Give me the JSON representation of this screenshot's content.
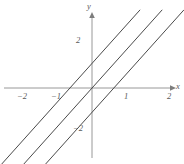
{
  "chart_data": {
    "type": "line",
    "title": "",
    "subtitle": "",
    "xlabel": "x",
    "ylabel": "y",
    "xlim": [
      -2.8,
      2.8
    ],
    "ylim": [
      -3.2,
      3.2
    ],
    "grid": false,
    "legend": null,
    "legend_position": "none",
    "xticks": [
      -2,
      -1,
      1,
      2
    ],
    "xticklabels": [
      "−2",
      "−1",
      "1",
      "2"
    ],
    "yticks": [
      2,
      -2
    ],
    "yticklabels": [
      "2",
      "−2"
    ],
    "axis_color": "#8c8c8c",
    "line_color": "#4a4a4a",
    "background": "#ffffff",
    "series": [
      {
        "name": "upper",
        "slope": 1.5,
        "intercept": 1,
        "x": [
          -2.8,
          1.45
        ],
        "y": [
          -3.2,
          3.18
        ]
      },
      {
        "name": "middle",
        "slope": 1.5,
        "intercept": 0,
        "x": [
          -2.13,
          2.12
        ],
        "y": [
          -3.2,
          3.18
        ]
      },
      {
        "name": "lower",
        "slope": 1.5,
        "intercept": -1,
        "x": [
          -1.47,
          2.78
        ],
        "y": [
          -3.2,
          3.18
        ]
      }
    ]
  },
  "axes": {
    "x_axis_label": "x",
    "y_axis_label": "y"
  },
  "labels": {
    "x_neg2": "−2",
    "x_neg1": "−1",
    "x_pos1": "1",
    "x_pos2": "2",
    "y_pos2": "2",
    "y_neg2": "−2"
  }
}
